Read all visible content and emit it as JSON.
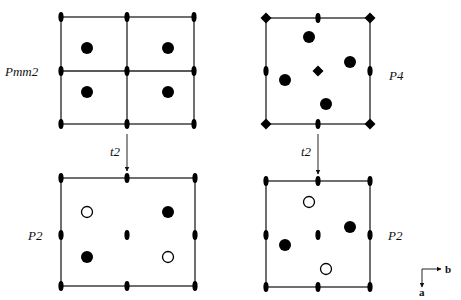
{
  "figure": {
    "colors": {
      "line": "#222222",
      "symbol": "#000000",
      "background": "#ffffff"
    },
    "panels": [
      {
        "id": "pmm2",
        "label": "Pmm2",
        "label_pos": [
          5,
          76
        ],
        "grid_x": [
          61,
          127,
          194
        ],
        "grid_y": [
          17,
          71,
          124
        ],
        "show_inner_lines": true,
        "axis_symbols": [
          {
            "type": "lens",
            "x": 61,
            "y": 17
          },
          {
            "type": "lens",
            "x": 127,
            "y": 17
          },
          {
            "type": "lens",
            "x": 194,
            "y": 17
          },
          {
            "type": "lens",
            "x": 61,
            "y": 71
          },
          {
            "type": "lens",
            "x": 127,
            "y": 71
          },
          {
            "type": "lens",
            "x": 194,
            "y": 71
          },
          {
            "type": "lens",
            "x": 61,
            "y": 124
          },
          {
            "type": "lens",
            "x": 127,
            "y": 124
          },
          {
            "type": "lens",
            "x": 194,
            "y": 124
          }
        ],
        "atoms": [
          {
            "x": 87,
            "y": 48,
            "filled": true
          },
          {
            "x": 168,
            "y": 48,
            "filled": true
          },
          {
            "x": 87,
            "y": 92,
            "filled": true
          },
          {
            "x": 168,
            "y": 92,
            "filled": true
          }
        ]
      },
      {
        "id": "p4",
        "label": "P4",
        "label_pos": [
          389,
          80
        ],
        "grid_x": [
          266,
          318,
          370
        ],
        "grid_y": [
          18,
          71,
          124
        ],
        "show_inner_lines": false,
        "axis_symbols": [
          {
            "type": "diamond",
            "x": 266,
            "y": 18
          },
          {
            "type": "lens",
            "x": 318,
            "y": 18
          },
          {
            "type": "diamond",
            "x": 370,
            "y": 18
          },
          {
            "type": "lens",
            "x": 266,
            "y": 71
          },
          {
            "type": "diamond",
            "x": 318,
            "y": 71
          },
          {
            "type": "lens",
            "x": 370,
            "y": 71
          },
          {
            "type": "diamond",
            "x": 266,
            "y": 124
          },
          {
            "type": "lens",
            "x": 318,
            "y": 124
          },
          {
            "type": "diamond",
            "x": 370,
            "y": 124
          }
        ],
        "atoms": [
          {
            "x": 309,
            "y": 37,
            "filled": true
          },
          {
            "x": 350,
            "y": 62,
            "filled": true
          },
          {
            "x": 285,
            "y": 80,
            "filled": true
          },
          {
            "x": 326,
            "y": 104,
            "filled": true
          }
        ]
      },
      {
        "id": "p2-left",
        "label": "P2",
        "label_pos": [
          28,
          240
        ],
        "grid_x": [
          61,
          127,
          195
        ],
        "grid_y": [
          178,
          235,
          286
        ],
        "show_inner_lines": false,
        "axis_symbols": [
          {
            "type": "lens",
            "x": 61,
            "y": 178
          },
          {
            "type": "lens",
            "x": 127,
            "y": 178
          },
          {
            "type": "lens",
            "x": 195,
            "y": 178
          },
          {
            "type": "lens",
            "x": 61,
            "y": 235
          },
          {
            "type": "lens",
            "x": 127,
            "y": 235
          },
          {
            "type": "lens",
            "x": 195,
            "y": 235
          },
          {
            "type": "lens",
            "x": 61,
            "y": 286
          },
          {
            "type": "lens",
            "x": 127,
            "y": 286
          },
          {
            "type": "lens",
            "x": 195,
            "y": 286
          }
        ],
        "atoms": [
          {
            "x": 87,
            "y": 212,
            "filled": false
          },
          {
            "x": 168,
            "y": 212,
            "filled": true
          },
          {
            "x": 87,
            "y": 257,
            "filled": true
          },
          {
            "x": 168,
            "y": 257,
            "filled": false
          }
        ]
      },
      {
        "id": "p2-right",
        "label": "P2",
        "label_pos": [
          388,
          240
        ],
        "grid_x": [
          266,
          318,
          370
        ],
        "grid_y": [
          181,
          235,
          287
        ],
        "show_inner_lines": false,
        "axis_symbols": [
          {
            "type": "lens",
            "x": 266,
            "y": 181
          },
          {
            "type": "lens",
            "x": 318,
            "y": 181
          },
          {
            "type": "lens",
            "x": 370,
            "y": 181
          },
          {
            "type": "lens",
            "x": 266,
            "y": 235
          },
          {
            "type": "lens",
            "x": 318,
            "y": 235
          },
          {
            "type": "lens",
            "x": 370,
            "y": 235
          },
          {
            "type": "lens",
            "x": 266,
            "y": 287
          },
          {
            "type": "lens",
            "x": 318,
            "y": 287
          },
          {
            "type": "lens",
            "x": 370,
            "y": 287
          }
        ],
        "atoms": [
          {
            "x": 309,
            "y": 202,
            "filled": false
          },
          {
            "x": 350,
            "y": 227,
            "filled": true
          },
          {
            "x": 285,
            "y": 245,
            "filled": true
          },
          {
            "x": 326,
            "y": 269,
            "filled": false
          }
        ]
      }
    ],
    "arrows": [
      {
        "label": "t2",
        "x": 127,
        "y1": 134,
        "y2": 171,
        "label_pos": [
          110,
          156
        ]
      },
      {
        "label": "t2",
        "x": 318,
        "y1": 134,
        "y2": 174,
        "label_pos": [
          301,
          156
        ]
      }
    ],
    "axes_key": {
      "origin": [
        422,
        269
      ],
      "b_label": "b",
      "a_label": "a",
      "b_end": [
        441,
        269
      ],
      "a_end": [
        422,
        287
      ]
    }
  }
}
